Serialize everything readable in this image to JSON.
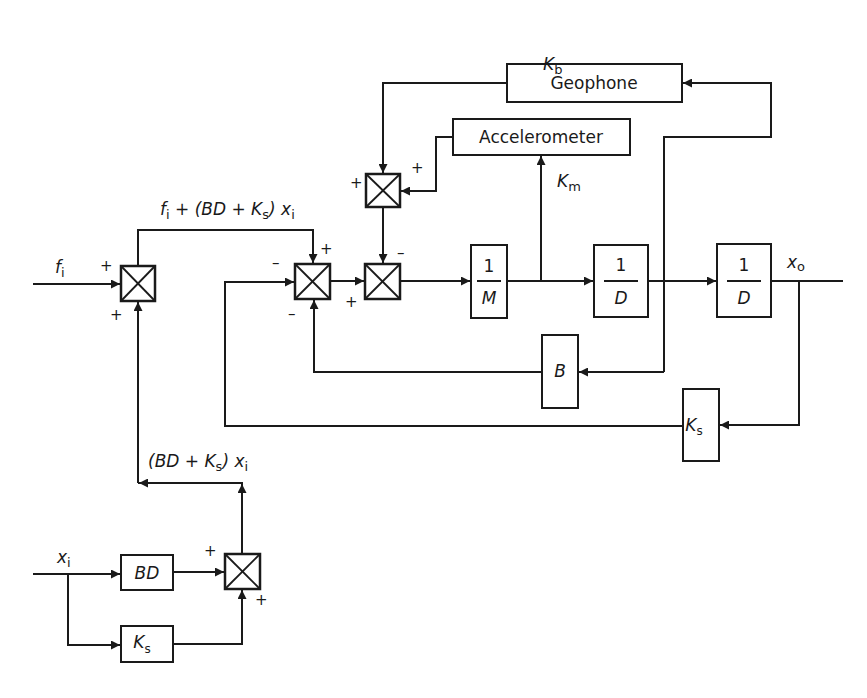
{
  "diagram": {
    "type": "control-system block diagram",
    "blocks": {
      "geophone": {
        "label": "Geophone",
        "gain_label": "K",
        "gain_sub": "b"
      },
      "accelerometer": {
        "label": "Accelerometer",
        "gain_label": "K",
        "gain_sub": "m"
      },
      "inv_mass": {
        "num": "1",
        "den": "M"
      },
      "integrator1": {
        "num": "1",
        "den": "D"
      },
      "integrator2": {
        "num": "1",
        "den": "D"
      },
      "damping": {
        "label": "B"
      },
      "spring_feedback": {
        "label": "K",
        "sub": "s"
      },
      "bd_block": {
        "label": "BD"
      },
      "ks_block": {
        "label": "K",
        "sub": "s"
      }
    },
    "signals": {
      "input_force": {
        "main": "f",
        "sub": "i"
      },
      "input_disp": {
        "main": "x",
        "sub": "i"
      },
      "output_disp": {
        "main": "x",
        "sub": "o"
      },
      "sum_top": {
        "f": "f",
        "fi": "i",
        "rest1": " + (BD + K",
        "ks": "s",
        "rest2": ") x",
        "xi": "i"
      },
      "sum_bottom": {
        "rest1": "(BD + K",
        "ks": "s",
        "rest2": ") x",
        "xi": "i"
      }
    },
    "signs": {
      "plus": "+",
      "minus": "–"
    }
  }
}
